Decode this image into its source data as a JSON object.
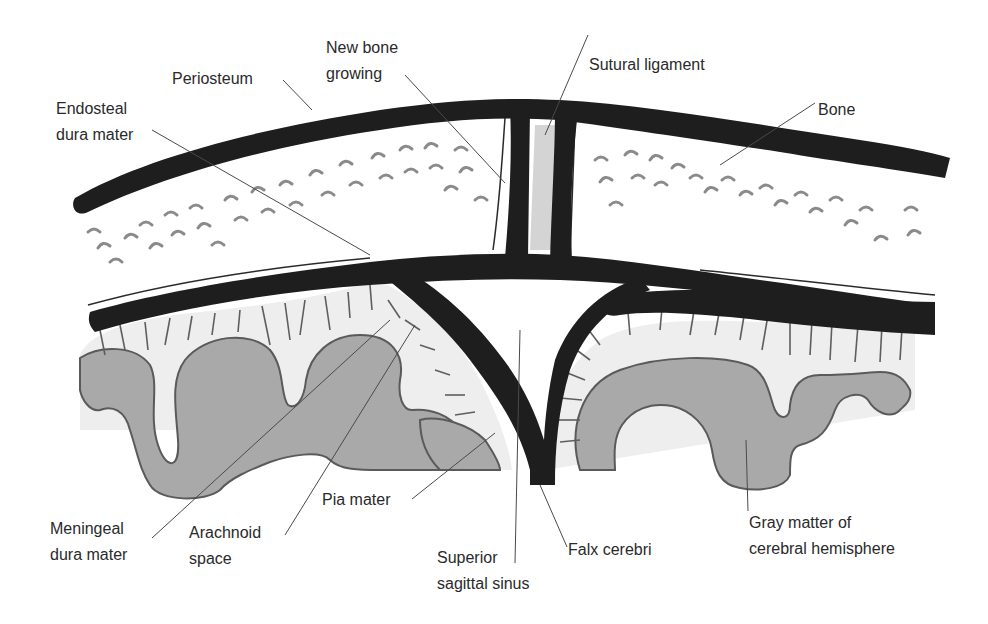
{
  "diagram": {
    "labels": {
      "periosteum": "Periosteum",
      "new_bone_line1": "New bone",
      "new_bone_line2": "growing",
      "sutural_ligament": "Sutural ligament",
      "endosteal_line1": "Endosteal",
      "endosteal_line2": "dura mater",
      "bone": "Bone",
      "meningeal_line1": "Meningeal",
      "meningeal_line2": "dura mater",
      "arachnoid_line1": "Arachnoid",
      "arachnoid_line2": "space",
      "pia_mater": "Pia mater",
      "superior_line1": "Superior",
      "superior_line2": "sagittal sinus",
      "falx_cerebri": "Falx cerebri",
      "gray_line1": "Gray matter of",
      "gray_line2": "cerebral hemisphere"
    },
    "colors": {
      "ink": "#1e1e1e",
      "gray_matter": "#a9a9a9",
      "arachnoid": "#eeeeee",
      "suture": "#d4d4d4",
      "text": "#2a2a2a"
    }
  }
}
